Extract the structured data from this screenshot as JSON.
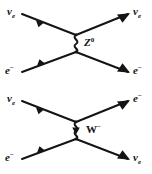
{
  "figure": {
    "ink_color": "#141414",
    "background_color": "#ffffff",
    "diagrams": [
      {
        "id": "neutral-current",
        "mediator": {
          "symbol": "Z",
          "charge": "0",
          "propagator_style": "wavy",
          "has_arrow": false
        },
        "incoming": [
          {
            "position": "top-left",
            "symbol": "ν",
            "subscript": "e",
            "superscript": ""
          },
          {
            "position": "bottom-left",
            "symbol": "e",
            "subscript": "",
            "superscript": "−"
          }
        ],
        "outgoing": [
          {
            "position": "top-right",
            "symbol": "ν",
            "subscript": "e",
            "superscript": ""
          },
          {
            "position": "bottom-right",
            "symbol": "e",
            "subscript": "",
            "superscript": "−"
          }
        ]
      },
      {
        "id": "charged-current",
        "mediator": {
          "symbol": "W",
          "charge": "−",
          "propagator_style": "wavy",
          "has_arrow": true
        },
        "incoming": [
          {
            "position": "top-left",
            "symbol": "ν",
            "subscript": "e",
            "superscript": ""
          },
          {
            "position": "bottom-left",
            "symbol": "e",
            "subscript": "",
            "superscript": "−"
          }
        ],
        "outgoing": [
          {
            "position": "top-right",
            "symbol": "e",
            "subscript": "",
            "superscript": "−"
          },
          {
            "position": "bottom-right",
            "symbol": "ν",
            "subscript": "e",
            "superscript": ""
          }
        ]
      }
    ]
  }
}
